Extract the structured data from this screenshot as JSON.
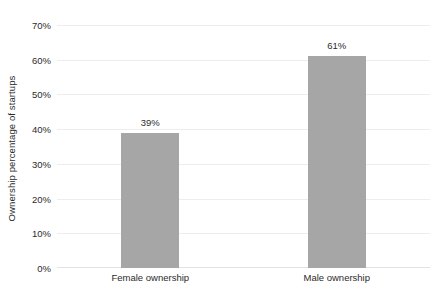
{
  "chart_data": {
    "type": "bar",
    "title": "",
    "xlabel": "",
    "ylabel": "Ownership percentage of startups",
    "categories": [
      "Female ownership",
      "Male ownership"
    ],
    "values": [
      39,
      61
    ],
    "value_labels": [
      "39%",
      "61%"
    ],
    "ylim": [
      0,
      70
    ],
    "ytick_values": [
      0,
      10,
      20,
      30,
      40,
      50,
      60,
      70
    ],
    "ytick_labels": [
      "0%",
      "10%",
      "20%",
      "30%",
      "40%",
      "50%",
      "60%",
      "70%"
    ],
    "grid": true,
    "legend": false,
    "legend_position": "none",
    "bar_color": "#a6a6a6",
    "gridline_color": "#ededed",
    "background_color": "#ffffff",
    "text_color": "#2b2b2b"
  }
}
